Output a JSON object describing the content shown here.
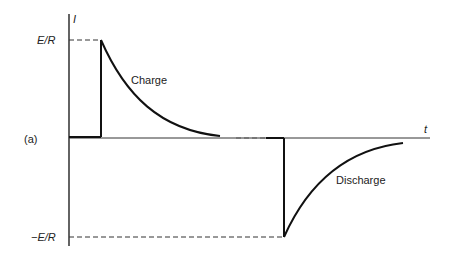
{
  "figure": {
    "panel_label": "(a)",
    "y_axis_label": "I",
    "x_axis_label": "t",
    "y_tick_top": "E/R",
    "y_tick_bottom": "−E/R",
    "charge_label": "Charge",
    "discharge_label": "Discharge",
    "line_color": "#111111"
  }
}
